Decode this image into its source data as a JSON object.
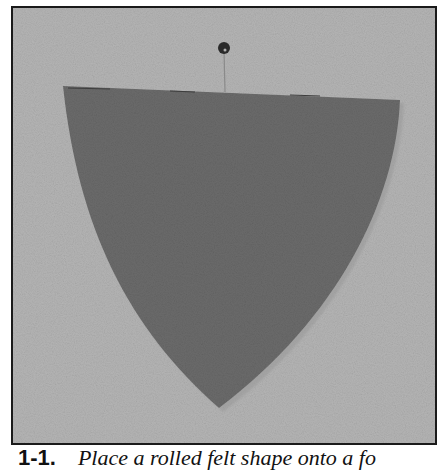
{
  "figure": {
    "colors": {
      "frame_border": "#1a1a1a",
      "background_board": "#b5b5b5",
      "felt": "#6b6b6b",
      "pin_head": "#2a2a2a",
      "pin_shaft": "#8a8a8a"
    }
  },
  "caption": {
    "number": "1-1.",
    "text": "Place a rolled felt shape onto a fo"
  }
}
